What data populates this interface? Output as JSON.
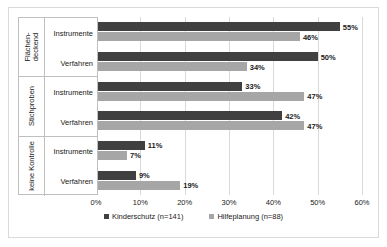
{
  "chart_data": {
    "type": "bar",
    "orientation": "horizontal",
    "title": "",
    "xlabel": "",
    "ylabel": "",
    "xlim": [
      0,
      60
    ],
    "xtick_labels": [
      "0%",
      "10%",
      "20%",
      "30%",
      "40%",
      "50%",
      "60%"
    ],
    "xtick_values": [
      0,
      10,
      20,
      30,
      40,
      50,
      60
    ],
    "grid": true,
    "legend_position": "bottom",
    "series": [
      {
        "name": "Kinderschutz (n=141)",
        "color": "#404040",
        "values": [
          55,
          50,
          33,
          42,
          11,
          9
        ],
        "labels": [
          "55%",
          "50%",
          "33%",
          "42%",
          "11%",
          "9%"
        ]
      },
      {
        "name": "Hilfeplanung (n=88)",
        "color": "#a6a6a6",
        "values": [
          46,
          34,
          47,
          47,
          7,
          19
        ],
        "labels": [
          "46%",
          "34%",
          "47%",
          "47%",
          "7%",
          "19%"
        ]
      }
    ],
    "categories": [
      "Instrumente",
      "Verfahren",
      "Instrumente",
      "Verfahren",
      "Instrumente",
      "Verfahren"
    ],
    "groups": [
      {
        "label": "Flächen-\ndeckend",
        "subcategories": [
          {
            "label": "Instrumente",
            "kinderschutz": 55,
            "hilfeplanung": 46,
            "kinderschutz_label": "55%",
            "hilfeplanung_label": "46%"
          },
          {
            "label": "Verfahren",
            "kinderschutz": 50,
            "hilfeplanung": 34,
            "kinderschutz_label": "50%",
            "hilfeplanung_label": "34%"
          }
        ]
      },
      {
        "label": "Stichproben",
        "subcategories": [
          {
            "label": "Instrumente",
            "kinderschutz": 33,
            "hilfeplanung": 47,
            "kinderschutz_label": "33%",
            "hilfeplanung_label": "47%"
          },
          {
            "label": "Verfahren",
            "kinderschutz": 42,
            "hilfeplanung": 47,
            "kinderschutz_label": "42%",
            "hilfeplanung_label": "47%"
          }
        ]
      },
      {
        "label": "keine Kontrolle",
        "subcategories": [
          {
            "label": "Instrumente",
            "kinderschutz": 11,
            "hilfeplanung": 7,
            "kinderschutz_label": "11%",
            "hilfeplanung_label": "7%"
          },
          {
            "label": "Verfahren",
            "kinderschutz": 9,
            "hilfeplanung": 19,
            "kinderschutz_label": "9%",
            "hilfeplanung_label": "19%"
          }
        ]
      }
    ]
  },
  "legend": {
    "items": [
      {
        "label": "Kinderschutz (n=141)",
        "color": "#404040"
      },
      {
        "label": "Hilfeplanung (n=88)",
        "color": "#a6a6a6"
      }
    ]
  }
}
